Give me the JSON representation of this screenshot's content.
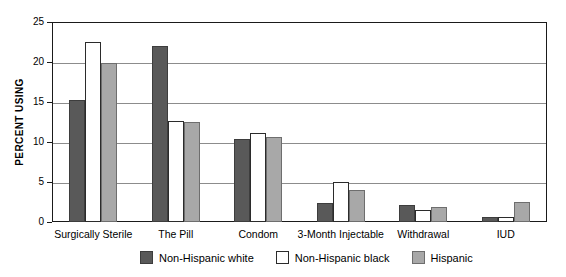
{
  "chart_data": {
    "type": "bar",
    "title": "",
    "subtitle": "",
    "xlabel": "",
    "ylabel": "PERCENT USING",
    "ylim": [
      0,
      25
    ],
    "yticks": [
      0,
      5,
      10,
      15,
      20,
      25
    ],
    "ytick_labels": [
      "0",
      "5",
      "10",
      "15",
      "20",
      "25"
    ],
    "grid": true,
    "legend_position": "bottom",
    "categories": [
      "Surgically Sterile",
      "The Pill",
      "Condom",
      "3-Month Injectable",
      "Withdrawal",
      "IUD"
    ],
    "series": [
      {
        "name": "Non-Hispanic white",
        "color": "#595959",
        "values": [
          15.3,
          22.0,
          10.4,
          2.4,
          2.1,
          0.6
        ]
      },
      {
        "name": "Non-Hispanic black",
        "color": "#ffffff",
        "values": [
          22.5,
          12.6,
          11.1,
          5.0,
          1.5,
          0.6
        ]
      },
      {
        "name": "Hispanic",
        "color": "#a8a8a8",
        "values": [
          19.9,
          12.5,
          10.6,
          4.0,
          1.9,
          2.5
        ]
      }
    ]
  },
  "axes": {
    "y_title": "PERCENT USING"
  },
  "colors": {
    "series_0": "#595959",
    "series_1": "#ffffff",
    "series_2": "#a8a8a8",
    "frame": "#1a1a1a",
    "gridline": "#8c8c8c",
    "background": "#ffffff"
  }
}
